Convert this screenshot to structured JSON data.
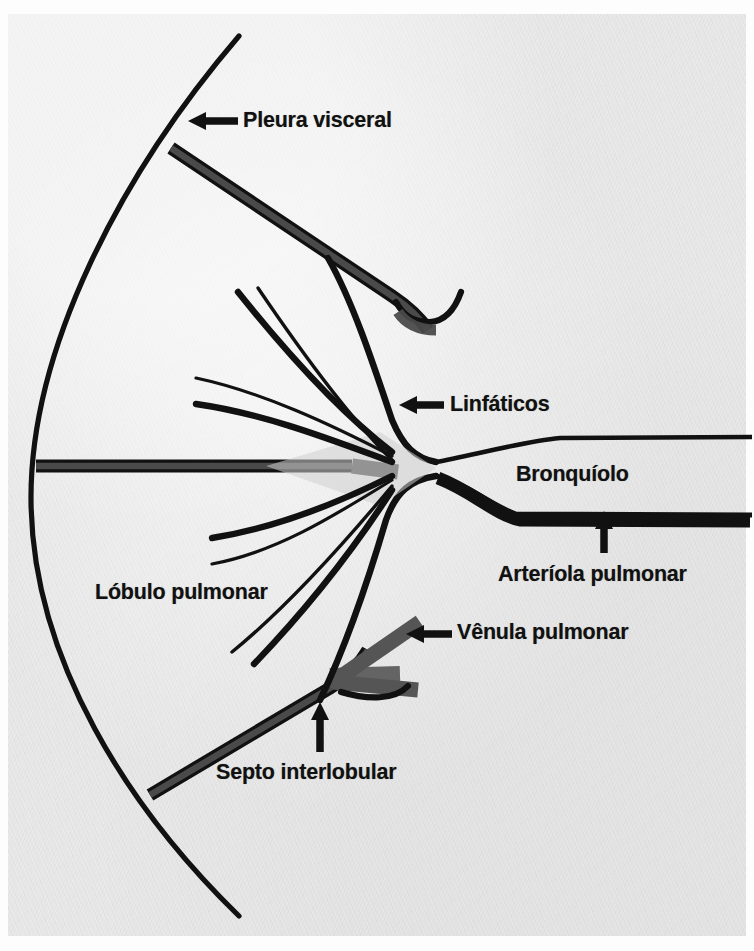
{
  "figure": {
    "background_color": "#e9e9e9",
    "ink_color": "#111111",
    "septum_fill_color": "#4a4a4a",
    "venule_fill_color": "#555555"
  },
  "labels": {
    "pleura": "Pleura visceral",
    "linfaticos": "Linfáticos",
    "bronquiolo": "Bronquíolo",
    "arteriola": "Arteríola pulmonar",
    "venula": "Vênula pulmonar",
    "lobulo": "Lóbulo pulmonar",
    "septo": "Septo interlobular"
  },
  "annotations": [
    {
      "label": "Pleura visceral",
      "arrow": "left-arrow-icon",
      "target": "pleural surface arc"
    },
    {
      "label": "Linfáticos",
      "arrow": "left-arrow-icon",
      "target": "lymphatic channels"
    },
    {
      "label": "Bronquíolo",
      "arrow": "none",
      "target": "central bronchiole"
    },
    {
      "label": "Arteríola pulmonar",
      "arrow": "up-arrow-icon",
      "target": "pulmonary arteriole"
    },
    {
      "label": "Vênula pulmonar",
      "arrow": "left-arrow-icon",
      "target": "pulmonary venule"
    },
    {
      "label": "Lóbulo pulmonar",
      "arrow": "none",
      "target": "pulmonary lobule region"
    },
    {
      "label": "Septo interlobular",
      "arrow": "up-arrow-icon",
      "target": "interlobular septum"
    }
  ]
}
